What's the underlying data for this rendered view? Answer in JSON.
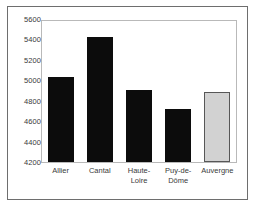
{
  "chart_data": {
    "type": "bar",
    "title": "",
    "subtitle": "",
    "xlabel": "",
    "ylabel": "",
    "categories": [
      "Allier",
      "Cantal",
      "Haute-\nLoire",
      "Puy-de-\nDôme",
      "Auvergne"
    ],
    "values": [
      5040,
      5430,
      4910,
      4730,
      4900
    ],
    "ylim": [
      4200,
      5600
    ],
    "yticks": [
      "5600",
      "5400",
      "5200",
      "5000",
      "4800",
      "4600",
      "4400",
      "4200"
    ],
    "ytick_values": [
      5600,
      5400,
      5200,
      5000,
      4800,
      4600,
      4400,
      4200
    ],
    "grid": false,
    "legend": "none",
    "bar_colors": [
      "#0c0c0c",
      "#0c0c0c",
      "#0c0c0c",
      "#0c0c0c",
      "#d2d2d2"
    ],
    "bar_border_colors": [
      "#0c0c0c",
      "#0c0c0c",
      "#0c0c0c",
      "#0c0c0c",
      "#575757"
    ]
  },
  "figure": {
    "frame_color": "#6e6e6e",
    "plot_border_color": "#b9b9b9",
    "background": "#ffffff",
    "text_color": "#3a3a3a"
  }
}
